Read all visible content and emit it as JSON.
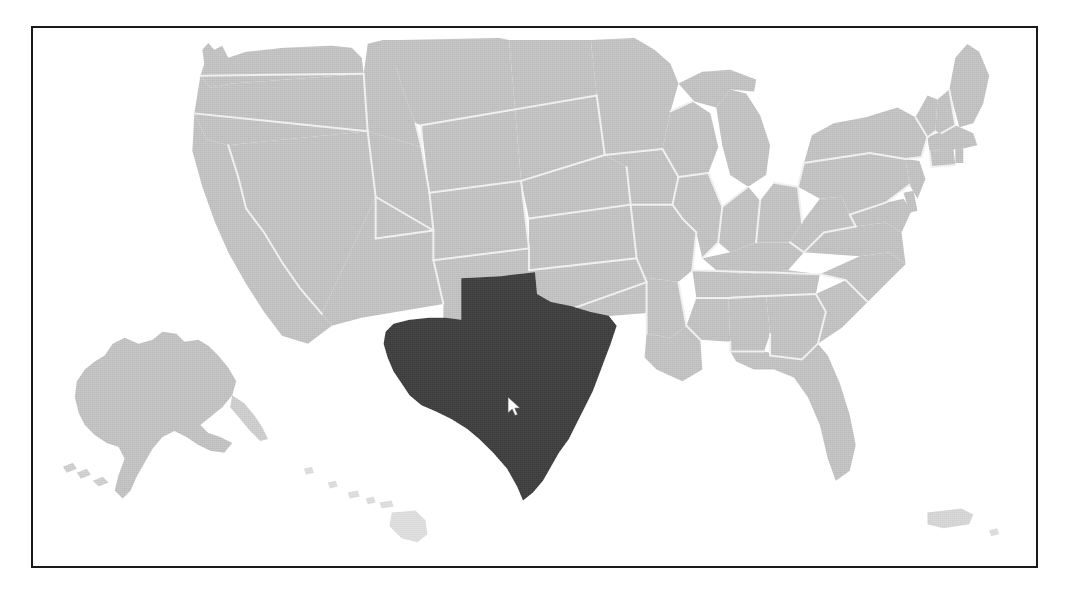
{
  "app": {
    "title": "US State Selection Map",
    "kind": "map-widget"
  },
  "frame": {
    "border_color": "#1a1a1a",
    "border_width_px": 2,
    "x": 31,
    "y": 26,
    "width": 1007,
    "height": 542,
    "background_color": "#ffffff"
  },
  "map": {
    "name": "united-states-map",
    "projection": "albers-usa",
    "base_fill_color": "#b9b9b9",
    "state_border_color": "#eeeeee",
    "selected_fill_color": "#3a3a3a",
    "ocean_color": "#ffffff",
    "selected_state": {
      "code": "TX",
      "name": "Texas",
      "fill_color": "#3a3a3a"
    },
    "insets": [
      {
        "code": "AK",
        "name": "Alaska",
        "fill_color": "#b9b9b9"
      },
      {
        "code": "HI",
        "name": "Hawaii",
        "fill_color": "#d8d8d8"
      },
      {
        "code": "PR",
        "name": "Puerto Rico",
        "fill_color": "#cfcfcf"
      }
    ],
    "states": [
      {
        "code": "WA",
        "name": "Washington",
        "selected": false
      },
      {
        "code": "OR",
        "name": "Oregon",
        "selected": false
      },
      {
        "code": "CA",
        "name": "California",
        "selected": false
      },
      {
        "code": "NV",
        "name": "Nevada",
        "selected": false
      },
      {
        "code": "ID",
        "name": "Idaho",
        "selected": false
      },
      {
        "code": "MT",
        "name": "Montana",
        "selected": false
      },
      {
        "code": "WY",
        "name": "Wyoming",
        "selected": false
      },
      {
        "code": "UT",
        "name": "Utah",
        "selected": false
      },
      {
        "code": "AZ",
        "name": "Arizona",
        "selected": false
      },
      {
        "code": "CO",
        "name": "Colorado",
        "selected": false
      },
      {
        "code": "NM",
        "name": "New Mexico",
        "selected": false
      },
      {
        "code": "ND",
        "name": "North Dakota",
        "selected": false
      },
      {
        "code": "SD",
        "name": "South Dakota",
        "selected": false
      },
      {
        "code": "NE",
        "name": "Nebraska",
        "selected": false
      },
      {
        "code": "KS",
        "name": "Kansas",
        "selected": false
      },
      {
        "code": "OK",
        "name": "Oklahoma",
        "selected": false
      },
      {
        "code": "TX",
        "name": "Texas",
        "selected": true
      },
      {
        "code": "MN",
        "name": "Minnesota",
        "selected": false
      },
      {
        "code": "IA",
        "name": "Iowa",
        "selected": false
      },
      {
        "code": "MO",
        "name": "Missouri",
        "selected": false
      },
      {
        "code": "AR",
        "name": "Arkansas",
        "selected": false
      },
      {
        "code": "LA",
        "name": "Louisiana",
        "selected": false
      },
      {
        "code": "WI",
        "name": "Wisconsin",
        "selected": false
      },
      {
        "code": "IL",
        "name": "Illinois",
        "selected": false
      },
      {
        "code": "MI",
        "name": "Michigan",
        "selected": false
      },
      {
        "code": "IN",
        "name": "Indiana",
        "selected": false
      },
      {
        "code": "OH",
        "name": "Ohio",
        "selected": false
      },
      {
        "code": "KY",
        "name": "Kentucky",
        "selected": false
      },
      {
        "code": "TN",
        "name": "Tennessee",
        "selected": false
      },
      {
        "code": "MS",
        "name": "Mississippi",
        "selected": false
      },
      {
        "code": "AL",
        "name": "Alabama",
        "selected": false
      },
      {
        "code": "GA",
        "name": "Georgia",
        "selected": false
      },
      {
        "code": "FL",
        "name": "Florida",
        "selected": false
      },
      {
        "code": "SC",
        "name": "South Carolina",
        "selected": false
      },
      {
        "code": "NC",
        "name": "North Carolina",
        "selected": false
      },
      {
        "code": "VA",
        "name": "Virginia",
        "selected": false
      },
      {
        "code": "WV",
        "name": "West Virginia",
        "selected": false
      },
      {
        "code": "MD",
        "name": "Maryland",
        "selected": false
      },
      {
        "code": "DE",
        "name": "Delaware",
        "selected": false
      },
      {
        "code": "PA",
        "name": "Pennsylvania",
        "selected": false
      },
      {
        "code": "NJ",
        "name": "New Jersey",
        "selected": false
      },
      {
        "code": "NY",
        "name": "New York",
        "selected": false
      },
      {
        "code": "CT",
        "name": "Connecticut",
        "selected": false
      },
      {
        "code": "RI",
        "name": "Rhode Island",
        "selected": false
      },
      {
        "code": "MA",
        "name": "Massachusetts",
        "selected": false
      },
      {
        "code": "VT",
        "name": "Vermont",
        "selected": false
      },
      {
        "code": "NH",
        "name": "New Hampshire",
        "selected": false
      },
      {
        "code": "ME",
        "name": "Maine",
        "selected": false
      },
      {
        "code": "AK",
        "name": "Alaska",
        "selected": false
      },
      {
        "code": "HI",
        "name": "Hawaii",
        "selected": false
      }
    ]
  },
  "cursor": {
    "icon": "arrow-pointer-icon",
    "color": "#ffffff",
    "outline_color": "#3a3a3a",
    "x": 506,
    "y": 396,
    "hovering_state": "Texas"
  }
}
